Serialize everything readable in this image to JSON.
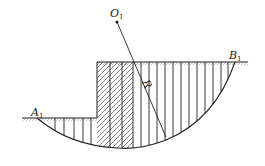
{
  "diagram": {
    "type": "slope-stability-slice-method",
    "labels": {
      "center": {
        "main": "O",
        "sub": "1"
      },
      "left_point": {
        "main": "A",
        "sub": "1"
      },
      "right_point": {
        "main": "B",
        "sub": "1"
      },
      "radius": "R"
    },
    "colors": {
      "line": "#222222",
      "ground_hatch": "#9a9a9a",
      "background": "#ffffff"
    },
    "geometry": {
      "center": [
        117,
        22
      ],
      "upper_ground_y": 62,
      "lower_ground_y": 118,
      "step_x": 97,
      "arc_start": [
        37,
        118
      ],
      "arc_end": [
        235,
        62
      ],
      "arc_bottom": [
        118,
        148
      ],
      "radius_end": [
        166,
        137
      ],
      "hatched_slices": 3,
      "left_slice_lines_x": [
        55,
        64,
        74,
        83,
        91
      ],
      "right_slice_lines_x": [
        141,
        149,
        157,
        165,
        173,
        181,
        189,
        197,
        205,
        213,
        221,
        228
      ]
    }
  }
}
